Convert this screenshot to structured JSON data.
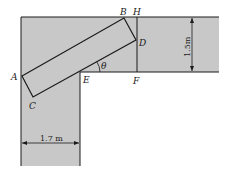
{
  "diagram": {
    "type": "corridor-corner-rod-geometry",
    "colors": {
      "corridor_fill": "#c8c8c8",
      "line": "#1a1a1a",
      "background": "#ffffff"
    },
    "points": {
      "A": "A",
      "B": "B",
      "C": "C",
      "D": "D",
      "E": "E",
      "F": "F",
      "H": "H"
    },
    "angle_label": "θ",
    "dimensions": {
      "horizontal_corridor_width": "1.5m",
      "vertical_corridor_width": "1.7 m"
    }
  }
}
